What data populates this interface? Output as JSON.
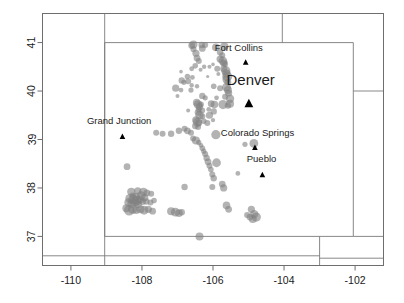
{
  "figure": {
    "name": "colorado-earthquake-scatter-map",
    "background": "#ffffff",
    "frame_color": "#6e6e6e",
    "boundary_color": "#7a7a7a",
    "point_color": "#808080",
    "point_opacity": 0.6,
    "marker_color": "#000000",
    "text_color": "#1a1a1a"
  },
  "axes": {
    "x": {
      "ticks": [
        "-110",
        "-108",
        "-106",
        "-104",
        "-102"
      ],
      "tick_values": [
        -110,
        -108,
        -106,
        -104,
        -102
      ],
      "range": [
        -110.8,
        -101.2
      ]
    },
    "y": {
      "ticks": [
        "37",
        "38",
        "39",
        "40",
        "41"
      ],
      "tick_values": [
        37,
        38,
        39,
        40,
        41
      ],
      "range": [
        36.4,
        41.6
      ]
    }
  },
  "cities": [
    {
      "name": "Fort Collins",
      "label": "Fort Collins",
      "lon": -105.08,
      "lat": 40.59,
      "label_lon": -105.95,
      "label_lat": 40.82,
      "size": "normal"
    },
    {
      "name": "Denver",
      "label": "Denver",
      "lon": -104.99,
      "lat": 39.74,
      "label_lon": -105.62,
      "label_lat": 40.13,
      "size": "major"
    },
    {
      "name": "Grand Junction",
      "label": "Grand Junction",
      "lon": -108.55,
      "lat": 39.06,
      "label_lon": -109.55,
      "label_lat": 39.33,
      "size": "normal"
    },
    {
      "name": "Colorado Springs",
      "label": "Colorado Springs",
      "lon": -104.82,
      "lat": 38.83,
      "label_lon": -105.78,
      "label_lat": 39.08,
      "size": "normal"
    },
    {
      "name": "Pueblo",
      "label": "Pueblo",
      "lon": -104.61,
      "lat": 38.27,
      "label_lon": -105.05,
      "label_lat": 38.53,
      "size": "normal"
    }
  ],
  "boundaries": [
    {
      "name": "colorado-state-outline",
      "points": [
        [
          -109.05,
          41.0
        ],
        [
          -102.05,
          41.0
        ],
        [
          -102.05,
          37.0
        ],
        [
          -109.05,
          37.0
        ],
        [
          -109.05,
          41.0
        ]
      ]
    },
    {
      "name": "wyoming-south-east-segment",
      "points": [
        [
          -104.05,
          41.6
        ],
        [
          -104.05,
          41.0
        ]
      ]
    },
    {
      "name": "nebraska-kansas-east-line",
      "points": [
        [
          -102.05,
          40.0
        ],
        [
          -101.2,
          40.0
        ]
      ]
    },
    {
      "name": "kansas-oklahoma-south-line",
      "points": [
        [
          -102.05,
          37.0
        ],
        [
          -101.2,
          37.0
        ]
      ]
    },
    {
      "name": "new-mexico-oklahoma-line",
      "points": [
        [
          -103.0,
          37.0
        ],
        [
          -103.0,
          36.4
        ]
      ]
    },
    {
      "name": "south-lower-band",
      "points": [
        [
          -110.8,
          36.6
        ],
        [
          -103.0,
          36.6
        ]
      ]
    },
    {
      "name": "southeast-lower-band",
      "points": [
        [
          -103.0,
          36.55
        ],
        [
          -101.2,
          36.55
        ]
      ]
    },
    {
      "name": "utah-arizona-west-line",
      "points": [
        [
          -109.05,
          41.6
        ],
        [
          -109.05,
          36.4
        ]
      ]
    }
  ],
  "chart_data": {
    "type": "scatter",
    "title": "",
    "xlabel": "",
    "ylabel": "",
    "xlim": [
      -110.8,
      -101.2
    ],
    "ylim": [
      36.4,
      41.6
    ],
    "grid": false,
    "legend": "none",
    "series": [
      {
        "name": "events",
        "marker": "circle",
        "color": "#808080",
        "opacity": 0.6,
        "points": [
          [
            -106.55,
            40.96,
            4.0
          ],
          [
            -106.6,
            40.94,
            3.4
          ],
          [
            -106.32,
            40.95,
            3.2
          ],
          [
            -106.22,
            40.95,
            3.0
          ],
          [
            -105.92,
            40.9,
            3.8
          ],
          [
            -105.68,
            40.92,
            4.2
          ],
          [
            -106.55,
            40.86,
            3.0
          ],
          [
            -106.3,
            40.88,
            3.4
          ],
          [
            -106.48,
            40.78,
            3.6
          ],
          [
            -105.8,
            40.8,
            3.2
          ],
          [
            -105.74,
            40.74,
            3.0
          ],
          [
            -106.45,
            40.68,
            3.4
          ],
          [
            -106.4,
            40.62,
            3.0
          ],
          [
            -105.8,
            40.66,
            3.6
          ],
          [
            -105.72,
            40.62,
            4.4
          ],
          [
            -105.7,
            40.58,
            3.6
          ],
          [
            -105.66,
            40.56,
            3.0
          ],
          [
            -106.5,
            40.52,
            2.8
          ],
          [
            -106.25,
            40.5,
            2.2
          ],
          [
            -106.1,
            40.5,
            2.0
          ],
          [
            -106.6,
            40.46,
            2.4
          ],
          [
            -106.35,
            40.44,
            2.0
          ],
          [
            -105.88,
            40.46,
            3.0
          ],
          [
            -105.7,
            40.46,
            3.4
          ],
          [
            -105.64,
            40.42,
            4.6
          ],
          [
            -105.62,
            40.36,
            4.2
          ],
          [
            -105.6,
            40.3,
            5.0
          ],
          [
            -105.62,
            40.24,
            4.0
          ],
          [
            -105.58,
            40.18,
            3.4
          ],
          [
            -106.72,
            40.3,
            2.8
          ],
          [
            -106.58,
            40.28,
            2.4
          ],
          [
            -106.88,
            40.22,
            3.2
          ],
          [
            -106.82,
            40.18,
            2.6
          ],
          [
            -106.7,
            40.2,
            3.0
          ],
          [
            -106.6,
            40.12,
            2.2
          ],
          [
            -107.05,
            40.06,
            3.6
          ],
          [
            -106.9,
            40.02,
            2.4
          ],
          [
            -106.62,
            40.02,
            2.6
          ],
          [
            -105.98,
            40.1,
            2.8
          ],
          [
            -105.8,
            40.06,
            3.0
          ],
          [
            -105.62,
            40.08,
            4.4
          ],
          [
            -105.58,
            40.02,
            4.0
          ],
          [
            -105.56,
            39.96,
            3.6
          ],
          [
            -106.3,
            39.9,
            3.2
          ],
          [
            -106.22,
            39.86,
            2.6
          ],
          [
            -105.9,
            39.86,
            2.4
          ],
          [
            -105.66,
            39.88,
            3.0
          ],
          [
            -105.52,
            39.84,
            4.2
          ],
          [
            -106.46,
            39.76,
            3.8
          ],
          [
            -106.42,
            39.72,
            4.4
          ],
          [
            -106.38,
            39.68,
            3.6
          ],
          [
            -106.34,
            39.72,
            3.0
          ],
          [
            -106.05,
            39.74,
            3.4
          ],
          [
            -105.96,
            39.72,
            3.8
          ],
          [
            -105.72,
            39.72,
            4.6
          ],
          [
            -105.58,
            39.7,
            3.2
          ],
          [
            -105.52,
            39.74,
            4.0
          ],
          [
            -106.4,
            39.62,
            3.0
          ],
          [
            -106.3,
            39.6,
            2.8
          ],
          [
            -106.12,
            39.62,
            2.4
          ],
          [
            -105.98,
            39.58,
            3.2
          ],
          [
            -106.42,
            39.56,
            3.4
          ],
          [
            -106.38,
            39.5,
            4.2
          ],
          [
            -106.3,
            39.48,
            3.0
          ],
          [
            -106.1,
            39.5,
            3.6
          ],
          [
            -106.48,
            39.4,
            3.8
          ],
          [
            -106.44,
            39.36,
            4.6
          ],
          [
            -106.4,
            39.34,
            3.4
          ],
          [
            -106.26,
            39.38,
            2.8
          ],
          [
            -106.16,
            39.34,
            3.0
          ],
          [
            -106.5,
            39.28,
            3.2
          ],
          [
            -106.42,
            39.26,
            3.0
          ],
          [
            -107.6,
            39.14,
            3.0
          ],
          [
            -107.42,
            39.12,
            3.0
          ],
          [
            -107.18,
            39.12,
            3.2
          ],
          [
            -106.96,
            39.18,
            3.2
          ],
          [
            -106.8,
            39.22,
            3.0
          ],
          [
            -106.72,
            39.18,
            3.4
          ],
          [
            -106.62,
            39.14,
            3.0
          ],
          [
            -105.92,
            39.1,
            4.6
          ],
          [
            -104.85,
            38.92,
            4.4
          ],
          [
            -106.56,
            39.02,
            3.0
          ],
          [
            -106.48,
            38.98,
            4.0
          ],
          [
            -106.4,
            38.94,
            2.6
          ],
          [
            -106.34,
            38.88,
            2.4
          ],
          [
            -106.3,
            38.82,
            2.8
          ],
          [
            -106.26,
            38.76,
            2.6
          ],
          [
            -106.22,
            38.7,
            3.0
          ],
          [
            -106.18,
            38.62,
            3.2
          ],
          [
            -106.14,
            38.54,
            3.4
          ],
          [
            -105.9,
            38.52,
            4.4
          ],
          [
            -106.1,
            38.46,
            3.0
          ],
          [
            -106.06,
            38.38,
            2.8
          ],
          [
            -108.42,
            38.44,
            3.4
          ],
          [
            -106.02,
            38.28,
            3.0
          ],
          [
            -105.98,
            38.2,
            3.2
          ],
          [
            -106.8,
            38.02,
            3.2
          ],
          [
            -106.02,
            38.02,
            3.0
          ],
          [
            -105.74,
            38.08,
            3.4
          ],
          [
            -105.7,
            38.0,
            3.6
          ],
          [
            -108.3,
            37.92,
            4.2
          ],
          [
            -108.12,
            37.94,
            3.6
          ],
          [
            -107.96,
            37.92,
            4.2
          ],
          [
            -107.86,
            37.9,
            3.4
          ],
          [
            -107.74,
            37.88,
            3.0
          ],
          [
            -108.26,
            37.84,
            3.2
          ],
          [
            -108.16,
            37.82,
            4.0
          ],
          [
            -108.02,
            37.84,
            4.4
          ],
          [
            -107.92,
            37.8,
            3.6
          ],
          [
            -108.34,
            37.78,
            4.6
          ],
          [
            -108.24,
            37.76,
            5.0
          ],
          [
            -108.14,
            37.74,
            4.8
          ],
          [
            -108.06,
            37.76,
            4.0
          ],
          [
            -107.98,
            37.72,
            3.4
          ],
          [
            -108.38,
            37.7,
            4.2
          ],
          [
            -108.28,
            37.68,
            4.6
          ],
          [
            -108.18,
            37.7,
            4.0
          ],
          [
            -108.1,
            37.66,
            3.6
          ],
          [
            -107.88,
            37.72,
            3.2
          ],
          [
            -107.76,
            37.7,
            3.0
          ],
          [
            -107.66,
            37.74,
            2.8
          ],
          [
            -105.62,
            37.64,
            3.8
          ],
          [
            -105.56,
            37.56,
            3.4
          ],
          [
            -108.44,
            37.58,
            4.0
          ],
          [
            -108.36,
            37.54,
            5.2
          ],
          [
            -108.26,
            37.56,
            4.6
          ],
          [
            -108.16,
            37.54,
            3.8
          ],
          [
            -108.04,
            37.56,
            4.0
          ],
          [
            -107.94,
            37.54,
            4.4
          ],
          [
            -107.82,
            37.56,
            3.6
          ],
          [
            -107.7,
            37.52,
            3.4
          ],
          [
            -107.18,
            37.52,
            4.0
          ],
          [
            -107.06,
            37.5,
            4.4
          ],
          [
            -106.96,
            37.48,
            3.8
          ],
          [
            -106.88,
            37.5,
            3.2
          ],
          [
            -104.92,
            37.56,
            3.6
          ],
          [
            -104.84,
            37.46,
            4.2
          ],
          [
            -104.78,
            37.4,
            4.6
          ],
          [
            -104.88,
            37.36,
            4.0
          ],
          [
            -104.96,
            37.4,
            3.4
          ],
          [
            -105.04,
            37.44,
            3.0
          ],
          [
            -106.38,
            37.0,
            4.0
          ],
          [
            -105.3,
            38.3,
            2.4
          ],
          [
            -105.1,
            38.9,
            2.6
          ],
          [
            -106.0,
            39.4,
            2.2
          ],
          [
            -106.7,
            39.6,
            2.0
          ],
          [
            -106.9,
            40.4,
            1.8
          ],
          [
            -106.15,
            40.3,
            1.6
          ],
          [
            -106.0,
            40.55,
            1.8
          ],
          [
            -105.85,
            40.35,
            2.0
          ],
          [
            -106.45,
            40.1,
            2.2
          ],
          [
            -107.0,
            39.9,
            2.0
          ]
        ]
      }
    ]
  }
}
